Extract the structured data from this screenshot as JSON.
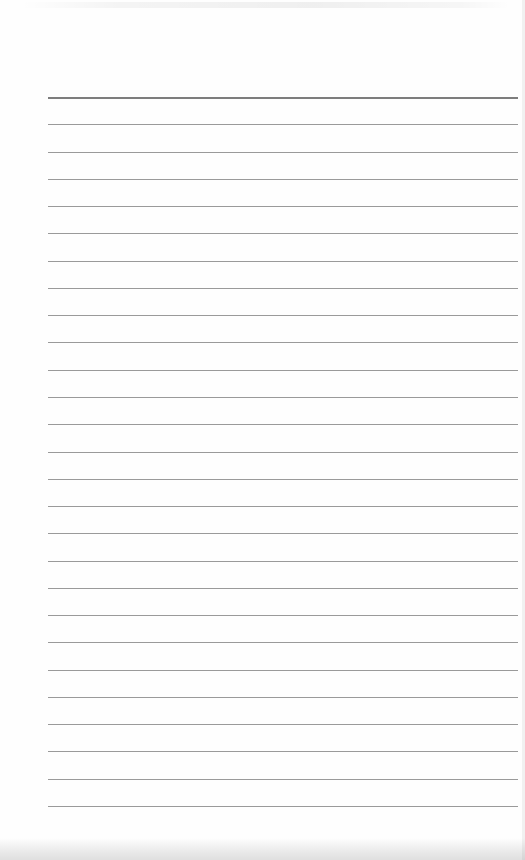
{
  "page": {
    "type": "ruled-notebook-sheet",
    "line_count": 27,
    "header_rule": true,
    "text_content": "",
    "line_color": "#9a9a9a",
    "header_line_color": "#7d7d7d",
    "paper_color": "#fefefe"
  }
}
